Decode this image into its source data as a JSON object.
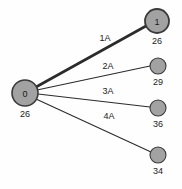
{
  "diagram": {
    "type": "node-link-graph",
    "background_color": "#fefefe",
    "node_fill_color": "#a2a2a2",
    "node_stroke_color": "#3a3a3a",
    "edge_color": "#2b2b2b",
    "text_color": "#1a1a1a",
    "nodes": [
      {
        "id": "root",
        "inner_label": "0",
        "value_label": "26",
        "cx": 25,
        "cy": 93,
        "r": 13,
        "stroke_width": 1.6,
        "has_inner_label": true
      },
      {
        "id": "child-1",
        "inner_label": "1",
        "value_label": "26",
        "cx": 157,
        "cy": 21,
        "r": 12,
        "stroke_width": 1.8,
        "has_inner_label": true
      },
      {
        "id": "child-2",
        "inner_label": "",
        "value_label": "29",
        "cx": 158,
        "cy": 66,
        "r": 8,
        "stroke_width": 1.1,
        "has_inner_label": false
      },
      {
        "id": "child-3",
        "inner_label": "",
        "value_label": "36",
        "cx": 158,
        "cy": 108,
        "r": 8,
        "stroke_width": 1.1,
        "has_inner_label": false
      },
      {
        "id": "child-4",
        "inner_label": "",
        "value_label": "34",
        "cx": 158,
        "cy": 155,
        "r": 8,
        "stroke_width": 1.1,
        "has_inner_label": false
      }
    ],
    "edges": [
      {
        "id": "edge-1a",
        "label": "1A",
        "from": "root",
        "to": "child-1",
        "x1": 36,
        "y1": 87,
        "x2": 146,
        "y2": 26,
        "stroke_width": 2.6,
        "label_x": 105,
        "label_y": 41
      },
      {
        "id": "edge-2a",
        "label": "2A",
        "from": "root",
        "to": "child-2",
        "x1": 37,
        "y1": 90,
        "x2": 150,
        "y2": 66,
        "stroke_width": 1.1,
        "label_x": 108,
        "label_y": 69
      },
      {
        "id": "edge-3a",
        "label": "3A",
        "from": "root",
        "to": "child-3",
        "x1": 38,
        "y1": 94,
        "x2": 150,
        "y2": 107,
        "stroke_width": 1.1,
        "label_x": 108,
        "label_y": 94
      },
      {
        "id": "edge-4a",
        "label": "4A",
        "from": "root",
        "to": "child-4",
        "x1": 36,
        "y1": 99,
        "x2": 151,
        "y2": 152,
        "stroke_width": 1.1,
        "label_x": 109,
        "label_y": 119
      }
    ]
  }
}
